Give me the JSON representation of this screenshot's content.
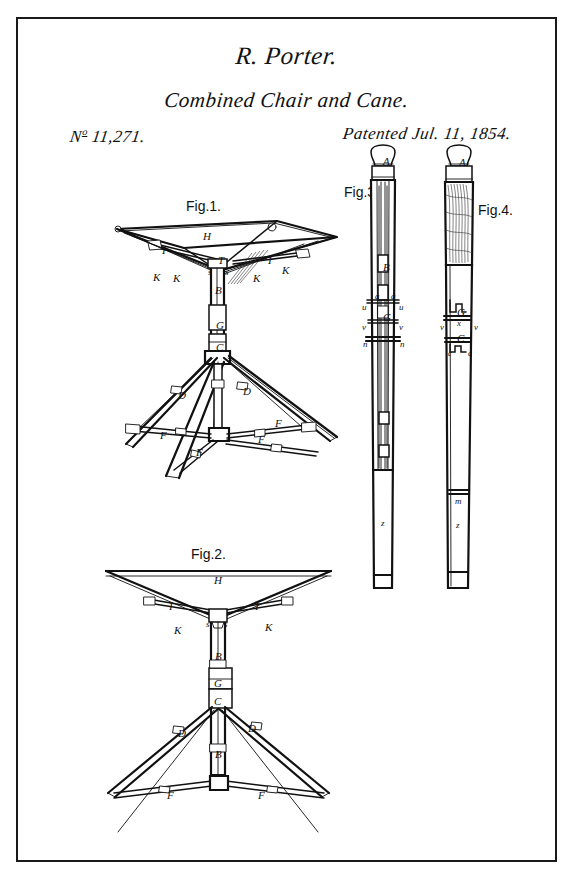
{
  "sheet": {
    "width": 573,
    "height": 872,
    "background_color": "#ffffff",
    "ink_color": "#111111",
    "border_color": "#1a1a1a"
  },
  "header": {
    "inventor": "R. Porter.",
    "title": "Combined Chair and Cane.",
    "number_prefix": "N",
    "number_superscript": "o",
    "number": "11,271.",
    "date": "Patented Jul. 11, 1854."
  },
  "figures": [
    {
      "id": "fig1",
      "caption": "Fig.1.",
      "description": "Perspective view of the combined chair opened, seat frame above tripod legs"
    },
    {
      "id": "fig2",
      "caption": "Fig.2.",
      "description": "Front elevation of the chair opened"
    },
    {
      "id": "fig3",
      "caption": "Fig.3.",
      "description": "Cane closed, sectional view showing interior rods"
    },
    {
      "id": "fig4",
      "caption": "Fig.4.",
      "description": "Cane closed, exterior view with ornamented grip"
    }
  ],
  "reference_letters": {
    "fig1": [
      {
        "label": "H",
        "x": 203,
        "y": 231
      },
      {
        "label": "I",
        "x": 162,
        "y": 245
      },
      {
        "label": "I",
        "x": 268,
        "y": 255
      },
      {
        "label": "T",
        "x": 218,
        "y": 255
      },
      {
        "label": "K",
        "x": 153,
        "y": 272
      },
      {
        "label": "K",
        "x": 173,
        "y": 273
      },
      {
        "label": "K",
        "x": 253,
        "y": 273
      },
      {
        "label": "K",
        "x": 282,
        "y": 265
      },
      {
        "label": "s",
        "x": 208,
        "y": 268
      },
      {
        "label": "s",
        "x": 225,
        "y": 268
      },
      {
        "label": "B",
        "x": 215,
        "y": 285
      },
      {
        "label": "G",
        "x": 216,
        "y": 320
      },
      {
        "label": "C",
        "x": 216,
        "y": 342
      },
      {
        "label": "D",
        "x": 178,
        "y": 390
      },
      {
        "label": "D",
        "x": 243,
        "y": 386
      },
      {
        "label": "F",
        "x": 160,
        "y": 430
      },
      {
        "label": "F",
        "x": 258,
        "y": 434
      },
      {
        "label": "F",
        "x": 196,
        "y": 447
      },
      {
        "label": "F",
        "x": 275,
        "y": 418
      }
    ],
    "fig2": [
      {
        "label": "H",
        "x": 214,
        "y": 575
      },
      {
        "label": "I",
        "x": 169,
        "y": 601
      },
      {
        "label": "I",
        "x": 255,
        "y": 601
      },
      {
        "label": "K",
        "x": 174,
        "y": 625
      },
      {
        "label": "K",
        "x": 265,
        "y": 622
      },
      {
        "label": "s",
        "x": 206,
        "y": 620
      },
      {
        "label": "s",
        "x": 224,
        "y": 620
      },
      {
        "label": "B",
        "x": 215,
        "y": 651
      },
      {
        "label": "G",
        "x": 214,
        "y": 678
      },
      {
        "label": "C",
        "x": 214,
        "y": 696
      },
      {
        "label": "D",
        "x": 178,
        "y": 728
      },
      {
        "label": "D",
        "x": 248,
        "y": 723
      },
      {
        "label": "F",
        "x": 167,
        "y": 790
      },
      {
        "label": "F",
        "x": 258,
        "y": 790
      },
      {
        "label": "B",
        "x": 215,
        "y": 749
      }
    ],
    "fig3": [
      {
        "label": "A",
        "x": 383,
        "y": 156
      },
      {
        "label": "B",
        "x": 383,
        "y": 262
      },
      {
        "label": "a",
        "x": 375,
        "y": 292
      },
      {
        "label": "a",
        "x": 391,
        "y": 292
      },
      {
        "label": "u",
        "x": 362,
        "y": 303
      },
      {
        "label": "u",
        "x": 399,
        "y": 303
      },
      {
        "label": "G",
        "x": 383,
        "y": 312
      },
      {
        "label": "v",
        "x": 362,
        "y": 323
      },
      {
        "label": "v",
        "x": 399,
        "y": 323
      },
      {
        "label": "n",
        "x": 363,
        "y": 340
      },
      {
        "label": "n",
        "x": 400,
        "y": 340
      },
      {
        "label": "z",
        "x": 381,
        "y": 519
      }
    ],
    "fig4": [
      {
        "label": "A",
        "x": 459,
        "y": 157
      },
      {
        "label": "G",
        "x": 457,
        "y": 307
      },
      {
        "label": "x",
        "x": 457,
        "y": 319
      },
      {
        "label": "v",
        "x": 440,
        "y": 323
      },
      {
        "label": "v",
        "x": 474,
        "y": 323
      },
      {
        "label": "C",
        "x": 457,
        "y": 333
      },
      {
        "label": "c",
        "x": 448,
        "y": 349
      },
      {
        "label": "c",
        "x": 468,
        "y": 349
      },
      {
        "label": "m",
        "x": 455,
        "y": 497
      },
      {
        "label": "z",
        "x": 456,
        "y": 521
      }
    ]
  }
}
